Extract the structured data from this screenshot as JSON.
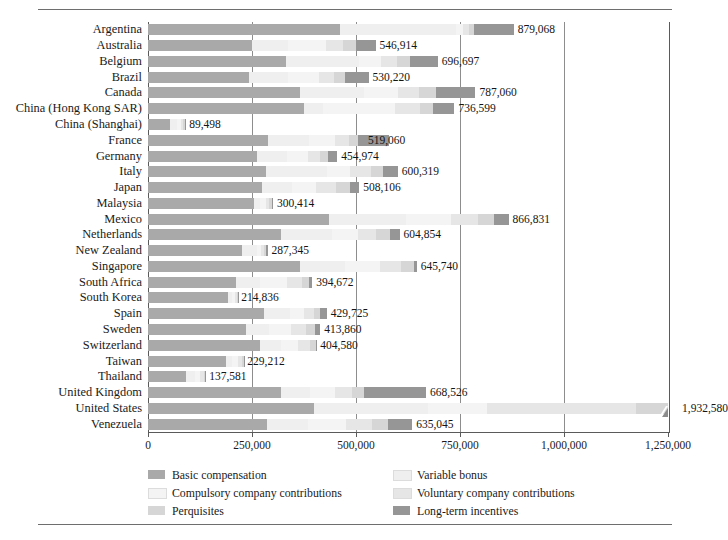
{
  "chart_data": {
    "type": "bar",
    "orientation": "horizontal",
    "stacked": true,
    "title": "",
    "xlabel": "",
    "ylabel": "",
    "xlim": [
      0,
      1250000
    ],
    "grid": true,
    "gridline_values": [
      250000,
      500000,
      750000,
      1000000
    ],
    "tick_labels": [
      "0",
      "250,000",
      "500,000",
      "750,000",
      "1,000,000",
      "1,250,000"
    ],
    "tick_values": [
      0,
      250000,
      500000,
      750000,
      1000000,
      1250000
    ],
    "legend_position": "bottom",
    "note": "United States bar is truncated at the axis maximum and marked with an axis-break glyph",
    "series": [
      {
        "name": "Basic compensation",
        "color": "#a9a9a9",
        "values": [
          462000,
          251000,
          332000,
          242000,
          365000,
          374000,
          52000,
          288000,
          262000,
          283000,
          275000,
          256000,
          434000,
          319000,
          227000,
          365000,
          212000,
          193000,
          278000,
          236000,
          270000,
          188000,
          92000,
          320000,
          398000,
          285000
        ]
      },
      {
        "name": "Variable bonus",
        "color": "#efefef",
        "values": [
          278000,
          86000,
          175000,
          95000,
          155000,
          46000,
          18000,
          100000,
          72000,
          148000,
          70000,
          13000,
          186000,
          124000,
          35000,
          108000,
          57000,
          10000,
          64000,
          56000,
          50000,
          15000,
          21000,
          69000,
          276000,
          100000
        ]
      },
      {
        "name": "Compulsory company contributions",
        "color": "#f4f4f4",
        "values": [
          18000,
          90000,
          52000,
          75000,
          82000,
          173000,
          10000,
          61000,
          50000,
          55000,
          60000,
          14000,
          108000,
          62000,
          9000,
          84000,
          66000,
          7000,
          34000,
          52000,
          41000,
          13000,
          13000,
          60000,
          142000,
          92000
        ]
      },
      {
        "name": "Voluntary company contributions",
        "color": "#e6e6e6",
        "values": [
          14000,
          42000,
          40000,
          34000,
          50000,
          61000,
          5000,
          35000,
          29000,
          50000,
          47000,
          9000,
          66000,
          44000,
          7000,
          52000,
          35000,
          4000,
          22000,
          35000,
          28000,
          9000,
          8000,
          41000,
          356000,
          62000
        ]
      },
      {
        "name": "Perquisites",
        "color": "#d6d6d6",
        "values": [
          12000,
          30000,
          30000,
          27000,
          41000,
          32000,
          3000,
          22000,
          20000,
          28000,
          33000,
          6000,
          38000,
          32000,
          5000,
          30000,
          18000,
          3000,
          16000,
          22000,
          14000,
          5000,
          4000,
          29000,
          438000,
          38000
        ]
      },
      {
        "name": "Long-term incentives",
        "color": "#969696",
        "values": [
          95068,
          47914,
          67697,
          57220,
          94060,
          50599,
          1498,
          73060,
          21974,
          36319,
          23106,
          2414,
          34831,
          23854,
          4345,
          6740,
          6672,
          1836,
          15725,
          12860,
          1580,
          212,
          581,
          148526,
          322580,
          58045
        ]
      }
    ],
    "categories": [
      "Argentina",
      "Australia",
      "Belgium",
      "Brazil",
      "Canada",
      "China (Hong Kong SAR)",
      "China (Shanghai)",
      "France",
      "Germany",
      "Italy",
      "Japan",
      "Malaysia",
      "Mexico",
      "Netherlands",
      "New Zealand",
      "Singapore",
      "South Africa",
      "South Korea",
      "Spain",
      "Sweden",
      "Switzerland",
      "Taiwan",
      "Thailand",
      "United Kingdom",
      "United States",
      "Venezuela"
    ],
    "totals": [
      879068,
      546914,
      696697,
      530220,
      787060,
      736599,
      89498,
      519060,
      454974,
      600319,
      508106,
      300414,
      866831,
      604854,
      287345,
      645740,
      394672,
      214836,
      429725,
      413860,
      404580,
      229212,
      137581,
      668526,
      1932580,
      635045
    ],
    "total_labels": [
      "879,068",
      "546,914",
      "696,697",
      "530,220",
      "787,060",
      "736,599",
      "89,498",
      "519,060",
      "454,974",
      "600,319",
      "508,106",
      "300,414",
      "866,831",
      "604,854",
      "287,345",
      "645,740",
      "394,672",
      "214,836",
      "429,725",
      "413,860",
      "404,580",
      "229,212",
      "137,581",
      "668,526",
      "1,932,580",
      "635,045"
    ]
  },
  "legend": {
    "items": [
      {
        "label": "Basic compensation",
        "color": "#a9a9a9"
      },
      {
        "label": "Compulsory company contributions",
        "color": "#f4f4f4"
      },
      {
        "label": "Perquisites",
        "color": "#d6d6d6"
      },
      {
        "label": "Variable bonus",
        "color": "#efefef"
      },
      {
        "label": "Voluntary company contributions",
        "color": "#e6e6e6"
      },
      {
        "label": "Long-term incentives",
        "color": "#969696"
      }
    ]
  }
}
